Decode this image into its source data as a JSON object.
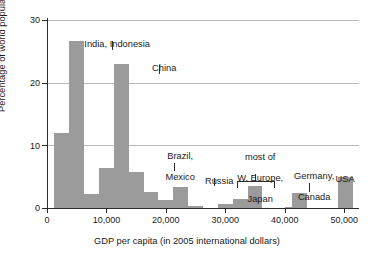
{
  "chart_data": {
    "type": "bar",
    "title": "",
    "subtitle": "",
    "xlabel": "GDP per capita (in 2005 international dollars)",
    "ylabel": "Percentage of world population",
    "xlim": [
      0,
      52500
    ],
    "ylim": [
      0,
      30
    ],
    "bin_width": 2500,
    "grid": "horizontal",
    "legend": "none",
    "bar_color": "#9b9b9b",
    "axis_color": "#2b2b2b",
    "grid_color": "#b9b9b9",
    "x_ticks": [
      0,
      10000,
      20000,
      30000,
      40000,
      50000
    ],
    "x_tick_labels": [
      "0",
      "10,000",
      "20,000",
      "30,000",
      "40,000",
      "50,000"
    ],
    "y_ticks": [
      0,
      10,
      20,
      30
    ],
    "y_tick_labels": [
      "0",
      "10",
      "20",
      "30"
    ],
    "bins": [
      {
        "x0": 1250,
        "x1": 3750,
        "value": 12.0
      },
      {
        "x0": 3750,
        "x1": 6250,
        "value": 26.7
      },
      {
        "x0": 6250,
        "x1": 8750,
        "value": 2.3
      },
      {
        "x0": 8750,
        "x1": 11250,
        "value": 6.4
      },
      {
        "x0": 11250,
        "x1": 13750,
        "value": 23.0
      },
      {
        "x0": 13750,
        "x1": 16250,
        "value": 5.7
      },
      {
        "x0": 16250,
        "x1": 18750,
        "value": 2.6
      },
      {
        "x0": 18750,
        "x1": 21250,
        "value": 1.2
      },
      {
        "x0": 21250,
        "x1": 23750,
        "value": 3.4
      },
      {
        "x0": 23750,
        "x1": 26250,
        "value": 0.25
      },
      {
        "x0": 28750,
        "x1": 31250,
        "value": 0.6
      },
      {
        "x0": 31250,
        "x1": 33750,
        "value": 1.5
      },
      {
        "x0": 33750,
        "x1": 36250,
        "value": 3.5
      },
      {
        "x0": 40000,
        "x1": 41250,
        "value": 0.12
      },
      {
        "x0": 41250,
        "x1": 43750,
        "value": 2.4
      },
      {
        "x0": 49000,
        "x1": 51500,
        "value": 5.0
      }
    ],
    "annotations": [
      {
        "id": "india-indonesia",
        "text": "India, Indonesia",
        "target_x": 5000,
        "lines": [
          "India, Indonesia"
        ]
      },
      {
        "id": "china",
        "text": "China",
        "target_x": 12500,
        "lines": [
          "China"
        ]
      },
      {
        "id": "brazil-mexico",
        "text": "Brazil, Mexico",
        "target_x": 15000,
        "lines": [
          "Brazil,",
          "Mexico"
        ]
      },
      {
        "id": "russia",
        "text": "Russia",
        "target_x": 22500,
        "lines": [
          "Russia"
        ]
      },
      {
        "id": "w-europe-japan",
        "text": "most of W. Europe, Japan",
        "target_x": 32500,
        "lines": [
          "most of",
          "W. Europe,",
          "Japan"
        ]
      },
      {
        "id": "germany-canada",
        "text": "Germany, Canada",
        "target_x": 42500,
        "lines": [
          "Germany,",
          "Canada"
        ]
      },
      {
        "id": "usa",
        "text": "USA",
        "target_x": 50250,
        "lines": [
          "USA"
        ]
      }
    ]
  },
  "axes": {
    "y_label": "Percentage of world population",
    "x_label": "GDP per capita (in 2005 international dollars)",
    "y_tick_0": "0",
    "y_tick_10": "10",
    "y_tick_20": "20",
    "y_tick_30": "30",
    "x_tick_0": "0",
    "x_tick_10k": "10,000",
    "x_tick_20k": "20,000",
    "x_tick_30k": "30,000",
    "x_tick_40k": "40,000",
    "x_tick_50k": "50,000"
  },
  "labels": {
    "india_indonesia": "India, Indonesia",
    "china": "China",
    "brazil": "Brazil,",
    "mexico": "Mexico",
    "russia": "Russia",
    "most_of": "most of",
    "w_europe": "W. Europe,",
    "japan": "Japan",
    "germany": "Germany,",
    "canada": "Canada",
    "usa": "USA"
  }
}
